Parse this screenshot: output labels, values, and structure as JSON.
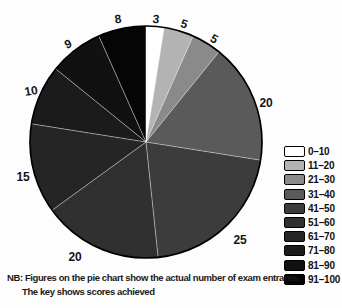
{
  "chart_data": {
    "type": "pie",
    "title": "",
    "categories": [
      "0–10",
      "11–20",
      "21–30",
      "31–40",
      "41–50",
      "51–60",
      "61–70",
      "71–80",
      "81–90",
      "91–100"
    ],
    "values": [
      3,
      5,
      5,
      20,
      25,
      20,
      15,
      10,
      9,
      8
    ],
    "total": 120,
    "start_angle_deg": 0,
    "direction": "clockwise",
    "legend_position": "right",
    "colors": [
      "#ffffff",
      "#b3b3b3",
      "#8a8a8a",
      "#5a5a5a",
      "#3c3c3c",
      "#303030",
      "#252525",
      "#1b1b1b",
      "#111111",
      "#050505"
    ],
    "outline_color": "#000000",
    "divider_color": "rgba(255,255,255,0.55)",
    "note_line1": "NB: Figures on the pie chart show the actual number of exam entrants.",
    "note_line2": "The key shows scores achieved"
  }
}
